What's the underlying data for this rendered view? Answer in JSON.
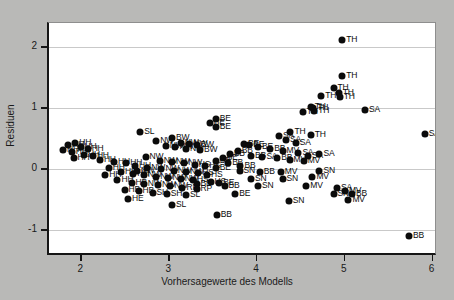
{
  "chart_data": {
    "type": "scatter",
    "title": "",
    "xlabel": "Vorhersagewerte des Modells",
    "ylabel": "Residuen",
    "xlim": [
      1.62,
      6.05
    ],
    "ylim": [
      -1.42,
      2.4
    ],
    "xticks": [
      2,
      3,
      4,
      5,
      6
    ],
    "yticks": [
      2,
      1,
      0,
      -1
    ],
    "xticklabels": [
      "2",
      "3",
      "4",
      "5",
      "6"
    ],
    "yticklabels": [
      "2",
      "1",
      "0",
      "-1"
    ],
    "grid": true,
    "legend": "none",
    "marker": "filled-circle",
    "point_color": "#0b0b0b",
    "plot_bg": "#ffffff",
    "figure_bg": "#b9b9b7",
    "grid_color": "#c9c9c9",
    "points": [
      {
        "x": 4.96,
        "y": 2.12,
        "label": "TH"
      },
      {
        "x": 4.96,
        "y": 1.53,
        "label": "TH"
      },
      {
        "x": 4.86,
        "y": 1.33,
        "label": "TH"
      },
      {
        "x": 4.92,
        "y": 1.26,
        "label": "TH"
      },
      {
        "x": 4.72,
        "y": 1.2,
        "label": "TH"
      },
      {
        "x": 4.93,
        "y": 1.19,
        "label": "TH"
      },
      {
        "x": 4.6,
        "y": 1.03,
        "label": "TH"
      },
      {
        "x": 4.63,
        "y": 1.0,
        "label": "TH"
      },
      {
        "x": 4.64,
        "y": 0.96,
        "label": "TH"
      },
      {
        "x": 4.51,
        "y": 0.94,
        "label": "TH"
      },
      {
        "x": 5.22,
        "y": 0.98,
        "label": "SA"
      },
      {
        "x": 5.9,
        "y": 0.58,
        "label": "SA"
      },
      {
        "x": 4.37,
        "y": 0.61,
        "label": "TH"
      },
      {
        "x": 4.24,
        "y": 0.55,
        "label": "SA"
      },
      {
        "x": 4.32,
        "y": 0.48,
        "label": "SA"
      },
      {
        "x": 4.43,
        "y": 0.44,
        "label": "SA"
      },
      {
        "x": 4.6,
        "y": 0.57,
        "label": "TH"
      },
      {
        "x": 3.52,
        "y": 0.83,
        "label": "BE"
      },
      {
        "x": 3.45,
        "y": 0.76,
        "label": "BE"
      },
      {
        "x": 3.52,
        "y": 0.69,
        "label": "BE"
      },
      {
        "x": 3.84,
        "y": 0.42,
        "label": "BE"
      },
      {
        "x": 3.9,
        "y": 0.4,
        "label": "BE"
      },
      {
        "x": 4.0,
        "y": 0.36,
        "label": "BE"
      },
      {
        "x": 4.14,
        "y": 0.33,
        "label": "BB"
      },
      {
        "x": 4.28,
        "y": 0.3,
        "label": "MV"
      },
      {
        "x": 4.46,
        "y": 0.27,
        "label": "SA"
      },
      {
        "x": 4.7,
        "y": 0.26,
        "label": "SA"
      },
      {
        "x": 4.57,
        "y": 0.22,
        "label": "SA"
      },
      {
        "x": 3.77,
        "y": 0.3,
        "label": "BB"
      },
      {
        "x": 3.68,
        "y": 0.26,
        "label": "BB"
      },
      {
        "x": 3.92,
        "y": 0.22,
        "label": "BB"
      },
      {
        "x": 4.05,
        "y": 0.2,
        "label": "SA"
      },
      {
        "x": 4.22,
        "y": 0.18,
        "label": "BB"
      },
      {
        "x": 4.36,
        "y": 0.16,
        "label": "MV"
      },
      {
        "x": 4.52,
        "y": 0.14,
        "label": "MV"
      },
      {
        "x": 3.6,
        "y": 0.18,
        "label": "BE"
      },
      {
        "x": 3.52,
        "y": 0.13,
        "label": "BB"
      },
      {
        "x": 3.66,
        "y": 0.1,
        "label": "BB"
      },
      {
        "x": 3.8,
        "y": 0.06,
        "label": "BB"
      },
      {
        "x": 3.52,
        "y": 0.02,
        "label": "BE"
      },
      {
        "x": 3.79,
        "y": -0.02,
        "label": "SN"
      },
      {
        "x": 4.02,
        "y": -0.04,
        "label": "BB"
      },
      {
        "x": 4.26,
        "y": -0.04,
        "label": "MV"
      },
      {
        "x": 4.7,
        "y": -0.02,
        "label": "SN"
      },
      {
        "x": 4.62,
        "y": -0.12,
        "label": "MV"
      },
      {
        "x": 3.92,
        "y": -0.16,
        "label": "SN"
      },
      {
        "x": 4.28,
        "y": -0.16,
        "label": "SN"
      },
      {
        "x": 3.56,
        "y": -0.22,
        "label": "BE"
      },
      {
        "x": 3.62,
        "y": -0.28,
        "label": "BB"
      },
      {
        "x": 3.3,
        "y": -0.24,
        "label": "BB"
      },
      {
        "x": 4.0,
        "y": -0.28,
        "label": "SN"
      },
      {
        "x": 4.55,
        "y": -0.28,
        "label": "MV"
      },
      {
        "x": 4.9,
        "y": -0.3,
        "label": "SA"
      },
      {
        "x": 4.99,
        "y": -0.36,
        "label": "MV"
      },
      {
        "x": 4.86,
        "y": -0.4,
        "label": "SN"
      },
      {
        "x": 5.07,
        "y": -0.4,
        "label": "BB"
      },
      {
        "x": 3.74,
        "y": -0.4,
        "label": "BE"
      },
      {
        "x": 5.03,
        "y": -0.5,
        "label": "MV"
      },
      {
        "x": 4.35,
        "y": -0.52,
        "label": "SN"
      },
      {
        "x": 3.53,
        "y": -0.74,
        "label": "BB"
      },
      {
        "x": 5.72,
        "y": -1.1,
        "label": "BB"
      },
      {
        "x": 2.66,
        "y": 0.62,
        "label": "SL"
      },
      {
        "x": 3.02,
        "y": 0.52,
        "label": "BW"
      },
      {
        "x": 2.84,
        "y": 0.46,
        "label": "NW"
      },
      {
        "x": 3.12,
        "y": 0.44,
        "label": "NW"
      },
      {
        "x": 3.22,
        "y": 0.42,
        "label": "NW"
      },
      {
        "x": 3.3,
        "y": 0.4,
        "label": "BW"
      },
      {
        "x": 2.95,
        "y": 0.38,
        "label": "NW"
      },
      {
        "x": 3.06,
        "y": 0.36,
        "label": "NW"
      },
      {
        "x": 3.18,
        "y": 0.34,
        "label": "NW"
      },
      {
        "x": 3.34,
        "y": 0.32,
        "label": "BW"
      },
      {
        "x": 1.92,
        "y": 0.44,
        "label": "HH"
      },
      {
        "x": 1.84,
        "y": 0.4,
        "label": "HH"
      },
      {
        "x": 1.98,
        "y": 0.36,
        "label": "HH"
      },
      {
        "x": 2.06,
        "y": 0.34,
        "label": "HH"
      },
      {
        "x": 1.78,
        "y": 0.32,
        "label": "HH"
      },
      {
        "x": 1.88,
        "y": 0.28,
        "label": "HH"
      },
      {
        "x": 2.02,
        "y": 0.24,
        "label": "HH"
      },
      {
        "x": 2.12,
        "y": 0.22,
        "label": "HH"
      },
      {
        "x": 1.9,
        "y": 0.18,
        "label": "HH"
      },
      {
        "x": 2.2,
        "y": 0.16,
        "label": "HH"
      },
      {
        "x": 2.36,
        "y": 0.12,
        "label": "HH"
      },
      {
        "x": 2.5,
        "y": 0.1,
        "label": "HH"
      },
      {
        "x": 2.72,
        "y": 0.2,
        "label": "NW"
      },
      {
        "x": 2.88,
        "y": 0.14,
        "label": "NW"
      },
      {
        "x": 3.02,
        "y": 0.12,
        "label": "NW"
      },
      {
        "x": 3.16,
        "y": 0.1,
        "label": "NW"
      },
      {
        "x": 3.28,
        "y": 0.08,
        "label": "HS"
      },
      {
        "x": 3.4,
        "y": 0.06,
        "label": "HS"
      },
      {
        "x": 2.6,
        "y": 0.06,
        "label": "HH"
      },
      {
        "x": 2.74,
        "y": 0.02,
        "label": "NW"
      },
      {
        "x": 2.9,
        "y": 0.0,
        "label": "NW"
      },
      {
        "x": 3.04,
        "y": -0.02,
        "label": "NW"
      },
      {
        "x": 3.18,
        "y": -0.04,
        "label": "NW"
      },
      {
        "x": 3.32,
        "y": -0.06,
        "label": "HS"
      },
      {
        "x": 2.44,
        "y": -0.04,
        "label": "HH"
      },
      {
        "x": 2.58,
        "y": -0.08,
        "label": "HH"
      },
      {
        "x": 2.7,
        "y": -0.1,
        "label": "NW"
      },
      {
        "x": 2.84,
        "y": -0.12,
        "label": "NW"
      },
      {
        "x": 2.98,
        "y": -0.14,
        "label": "NW"
      },
      {
        "x": 3.12,
        "y": -0.16,
        "label": "NW"
      },
      {
        "x": 3.26,
        "y": -0.18,
        "label": "HS"
      },
      {
        "x": 2.4,
        "y": -0.18,
        "label": "HH"
      },
      {
        "x": 2.56,
        "y": -0.22,
        "label": "HB"
      },
      {
        "x": 2.7,
        "y": -0.24,
        "label": "NW"
      },
      {
        "x": 2.86,
        "y": -0.26,
        "label": "NW"
      },
      {
        "x": 3.0,
        "y": -0.28,
        "label": "NW"
      },
      {
        "x": 3.14,
        "y": -0.3,
        "label": "RP"
      },
      {
        "x": 3.3,
        "y": -0.32,
        "label": "RP"
      },
      {
        "x": 2.48,
        "y": -0.34,
        "label": "HB"
      },
      {
        "x": 2.64,
        "y": -0.36,
        "label": "HB"
      },
      {
        "x": 2.8,
        "y": -0.38,
        "label": "SH"
      },
      {
        "x": 2.96,
        "y": -0.4,
        "label": "SH"
      },
      {
        "x": 3.18,
        "y": -0.42,
        "label": "SL"
      },
      {
        "x": 2.52,
        "y": -0.48,
        "label": "HE"
      },
      {
        "x": 3.02,
        "y": -0.58,
        "label": "SL"
      },
      {
        "x": 2.26,
        "y": -0.1,
        "label": "HH"
      },
      {
        "x": 2.3,
        "y": 0.02,
        "label": "HH"
      },
      {
        "x": 2.62,
        "y": -0.02,
        "label": "NW"
      },
      {
        "x": 3.42,
        "y": -0.1,
        "label": "HS"
      },
      {
        "x": 3.46,
        "y": -0.2,
        "label": "HS"
      }
    ]
  }
}
